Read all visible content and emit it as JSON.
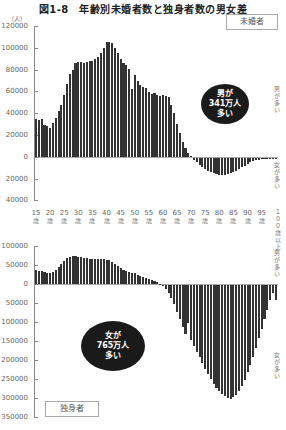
{
  "title": "図1-8　年齢別未婚者数と独身者数の男女差",
  "unit": "（人）",
  "top_chart": {
    "label": "未婚者",
    "bubble": [
      "男が",
      "341万人",
      "多い"
    ],
    "side_top": "男が多い",
    "side_bottom": "女が多い",
    "yticks": [
      "120000",
      "100000",
      "80000",
      "60000",
      "40000",
      "20000",
      "0",
      "20000",
      "40000"
    ]
  },
  "bottom_chart": {
    "label": "独身者",
    "bubble": [
      "女が",
      "765万人",
      "多い"
    ],
    "side_top": "男が多い",
    "side_bottom": "女が多い",
    "yticks": [
      "100000",
      "50000",
      "0",
      "50000",
      "100000",
      "150000",
      "200000",
      "250000",
      "300000",
      "350000"
    ]
  },
  "xlabels": [
    "15",
    "20",
    "25",
    "30",
    "35",
    "40",
    "45",
    "50",
    "55",
    "60",
    "65",
    "70",
    "75",
    "80",
    "85",
    "90",
    "95"
  ],
  "x_suffix": "歳",
  "x_last": "１００歳以上",
  "chart_data": [
    {
      "type": "bar",
      "title": "未婚者（男性数−女性数）",
      "xlabel": "年齢",
      "ylabel": "人",
      "ylim": [
        -40000,
        120000
      ],
      "categories": [
        "15",
        "16",
        "17",
        "18",
        "19",
        "20",
        "21",
        "22",
        "23",
        "24",
        "25",
        "26",
        "27",
        "28",
        "29",
        "30",
        "31",
        "32",
        "33",
        "34",
        "35",
        "36",
        "37",
        "38",
        "39",
        "40",
        "41",
        "42",
        "43",
        "44",
        "45",
        "46",
        "47",
        "48",
        "49",
        "50",
        "51",
        "52",
        "53",
        "54",
        "55",
        "56",
        "57",
        "58",
        "59",
        "60",
        "61",
        "62",
        "63",
        "64",
        "65",
        "66",
        "67",
        "68",
        "69",
        "70",
        "71",
        "72",
        "73",
        "74",
        "75",
        "76",
        "77",
        "78",
        "79",
        "80",
        "81",
        "82",
        "83",
        "84",
        "85",
        "86",
        "87",
        "88",
        "89",
        "90",
        "91",
        "92",
        "93",
        "94",
        "95",
        "96",
        "97",
        "98",
        "99",
        "100以上"
      ],
      "values": [
        35000,
        34000,
        35000,
        29000,
        28000,
        27000,
        31000,
        36000,
        42000,
        48000,
        57000,
        67000,
        76000,
        80000,
        86000,
        87000,
        87000,
        86000,
        87000,
        88000,
        88000,
        90000,
        92000,
        95000,
        100000,
        105000,
        105000,
        104000,
        100000,
        95000,
        90000,
        86000,
        84000,
        81000,
        62000,
        75000,
        70000,
        66000,
        64000,
        63000,
        60000,
        58000,
        59000,
        57000,
        56000,
        57000,
        56000,
        55000,
        48000,
        40000,
        30000,
        22000,
        14000,
        8000,
        4000,
        1000,
        -2000,
        -4000,
        -6000,
        -8000,
        -10000,
        -12000,
        -13000,
        -14000,
        -15000,
        -16000,
        -16000,
        -15500,
        -15000,
        -14000,
        -13000,
        -12000,
        -10000,
        -8000,
        -7000,
        -5500,
        -4000,
        -3000,
        -2000,
        -1500,
        -1000,
        -800,
        -500,
        -300,
        -200,
        -1000
      ],
      "annotation": "男が341万人多い"
    },
    {
      "type": "bar",
      "title": "独身者（男性数−女性数）",
      "xlabel": "年齢",
      "ylabel": "人",
      "ylim": [
        -350000,
        100000
      ],
      "categories": [
        "15",
        "16",
        "17",
        "18",
        "19",
        "20",
        "21",
        "22",
        "23",
        "24",
        "25",
        "26",
        "27",
        "28",
        "29",
        "30",
        "31",
        "32",
        "33",
        "34",
        "35",
        "36",
        "37",
        "38",
        "39",
        "40",
        "41",
        "42",
        "43",
        "44",
        "45",
        "46",
        "47",
        "48",
        "49",
        "50",
        "51",
        "52",
        "53",
        "54",
        "55",
        "56",
        "57",
        "58",
        "59",
        "60",
        "61",
        "62",
        "63",
        "64",
        "65",
        "66",
        "67",
        "68",
        "69",
        "70",
        "71",
        "72",
        "73",
        "74",
        "75",
        "76",
        "77",
        "78",
        "79",
        "80",
        "81",
        "82",
        "83",
        "84",
        "85",
        "86",
        "87",
        "88",
        "89",
        "90",
        "91",
        "92",
        "93",
        "94",
        "95",
        "96",
        "97",
        "98",
        "99",
        "100以上"
      ],
      "values": [
        36000,
        35000,
        34000,
        31000,
        30000,
        29000,
        32000,
        37000,
        44000,
        52000,
        60000,
        68000,
        72000,
        74000,
        73000,
        72000,
        70000,
        69000,
        68000,
        67000,
        66000,
        66000,
        65000,
        65000,
        65000,
        64000,
        62000,
        58000,
        53000,
        47000,
        42000,
        38000,
        35000,
        32000,
        30000,
        28000,
        25000,
        22000,
        19000,
        16000,
        13000,
        10000,
        7000,
        4000,
        1000,
        -3000,
        -10000,
        -20000,
        -35000,
        -50000,
        -70000,
        -90000,
        -110000,
        -130000,
        -100000,
        -145000,
        -160000,
        -175000,
        -190000,
        -205000,
        -220000,
        -235000,
        -248000,
        -260000,
        -270000,
        -280000,
        -288000,
        -293000,
        -297000,
        -300000,
        -296000,
        -290000,
        -280000,
        -265000,
        -250000,
        -230000,
        -210000,
        -190000,
        -165000,
        -140000,
        -115000,
        -90000,
        -65000,
        -40000,
        -20000,
        -40000
      ],
      "annotation": "女が765万人多い"
    }
  ]
}
